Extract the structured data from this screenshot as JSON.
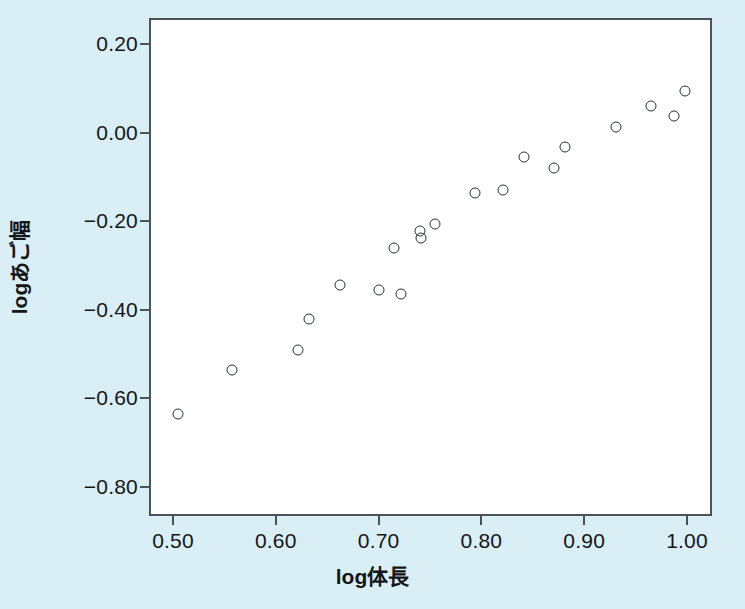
{
  "chart_data": {
    "type": "scatter",
    "title": "",
    "xlabel": "log体長",
    "ylabel": "logあご幅",
    "xlim": [
      0.47,
      1.015
    ],
    "ylim": [
      -0.855,
      0.245
    ],
    "xticks": [
      "0.50",
      "0.60",
      "0.70",
      "0.80",
      "0.90",
      "1.00"
    ],
    "xtick_values": [
      0.5,
      0.6,
      0.7,
      0.8,
      0.9,
      1.0
    ],
    "yticks": [
      "0.20",
      "0.00",
      "−0.20",
      "−0.40",
      "−0.60",
      "−0.80"
    ],
    "ytick_values": [
      0.2,
      0.0,
      -0.2,
      -0.4,
      -0.6,
      -0.8
    ],
    "grid": false,
    "legend": null,
    "marker": "open-circle",
    "marker_color": "#2b3136",
    "background_color": "#daeef5",
    "plot_background_color": "#ffffff",
    "axis_color": "#4b5358",
    "x": [
      0.505,
      0.557,
      0.622,
      0.632,
      0.662,
      0.7,
      0.715,
      0.722,
      0.74,
      0.741,
      0.755,
      0.794,
      0.821,
      0.841,
      0.871,
      0.881,
      0.931,
      0.965,
      0.987,
      0.998
    ],
    "y": [
      -0.635,
      -0.535,
      -0.49,
      -0.42,
      -0.345,
      -0.355,
      -0.26,
      -0.365,
      -0.223,
      -0.238,
      -0.206,
      -0.136,
      -0.13,
      -0.055,
      -0.08,
      -0.032,
      0.012,
      0.06,
      0.037,
      0.095
    ],
    "points": [
      {
        "x": 0.505,
        "y": -0.635
      },
      {
        "x": 0.557,
        "y": -0.535
      },
      {
        "x": 0.622,
        "y": -0.49
      },
      {
        "x": 0.632,
        "y": -0.42
      },
      {
        "x": 0.662,
        "y": -0.345
      },
      {
        "x": 0.7,
        "y": -0.355
      },
      {
        "x": 0.715,
        "y": -0.26
      },
      {
        "x": 0.722,
        "y": -0.365
      },
      {
        "x": 0.74,
        "y": -0.223
      },
      {
        "x": 0.741,
        "y": -0.238
      },
      {
        "x": 0.755,
        "y": -0.206
      },
      {
        "x": 0.794,
        "y": -0.136
      },
      {
        "x": 0.821,
        "y": -0.13
      },
      {
        "x": 0.841,
        "y": -0.055
      },
      {
        "x": 0.871,
        "y": -0.08
      },
      {
        "x": 0.881,
        "y": -0.032
      },
      {
        "x": 0.931,
        "y": 0.012
      },
      {
        "x": 0.965,
        "y": 0.06
      },
      {
        "x": 0.987,
        "y": 0.037
      },
      {
        "x": 0.998,
        "y": 0.095
      }
    ],
    "n_points": 20
  }
}
